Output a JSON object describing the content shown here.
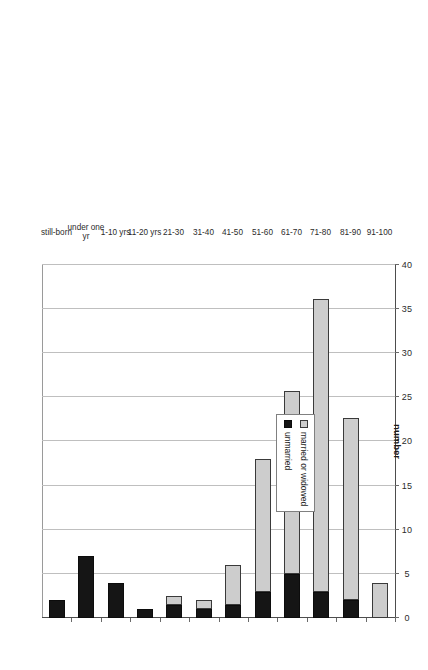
{
  "chart_data": {
    "type": "bar",
    "orientation": "vertical-rotated",
    "title": "",
    "xlabel": "",
    "ylabel": "number",
    "ylim": [
      0,
      40
    ],
    "ytick_step": 5,
    "ytick_labels": [
      "0",
      "5",
      "10",
      "15",
      "20",
      "25",
      "30",
      "35",
      "40"
    ],
    "grid": true,
    "stacked": true,
    "legend_position": "inside-left",
    "categories": [
      "still-born",
      "under one yr",
      "1-10 yrs",
      "11-20 yrs",
      "21-30",
      "31-40",
      "41-50",
      "51-60",
      "61-70",
      "71-80",
      "81-90",
      "91-100"
    ],
    "series": [
      {
        "name": "unmarried",
        "color": "#151515",
        "values": [
          2,
          7,
          4,
          1,
          1.5,
          1,
          1.5,
          3,
          5,
          3,
          2,
          0
        ]
      },
      {
        "name": "married or widowed",
        "color": "#cdcdcd",
        "values": [
          0,
          0,
          0,
          0,
          1,
          1,
          4.5,
          15,
          20.7,
          33.2,
          20.7,
          4
        ]
      }
    ],
    "totals": [
      2,
      7,
      4,
      1,
      2.5,
      2,
      6,
      18,
      25.7,
      36.2,
      22.7,
      4
    ]
  },
  "legend": {
    "entries": [
      {
        "label": "married or widowed",
        "swatch": "legend-swatch-married"
      },
      {
        "label": "unmarried",
        "swatch": "legend-swatch-unmarried"
      }
    ]
  },
  "axes": {
    "value_axis_title": "number"
  }
}
